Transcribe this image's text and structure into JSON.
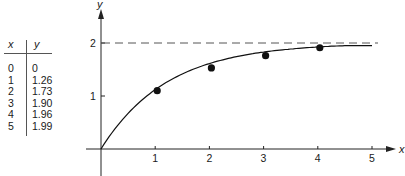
{
  "table": {
    "headers": [
      "x",
      "y"
    ],
    "rows": [
      {
        "x": "0",
        "y": "0"
      },
      {
        "x": "1",
        "y": "1.26"
      },
      {
        "x": "2",
        "y": "1.73"
      },
      {
        "x": "3",
        "y": "1.90"
      },
      {
        "x": "4",
        "y": "1.96"
      },
      {
        "x": "5",
        "y": "1.99"
      }
    ]
  },
  "chart_data": {
    "type": "line",
    "title": "",
    "xlabel": "x",
    "ylabel": "y",
    "x_ticks": [
      "1",
      "2",
      "3",
      "4",
      "5"
    ],
    "y_ticks": [
      "1",
      "2"
    ],
    "xlim": [
      0,
      5
    ],
    "ylim": [
      0,
      2
    ],
    "asymptote": {
      "y": 2,
      "style": "dashed"
    },
    "series": [
      {
        "name": "curve",
        "style": "line",
        "x": [
          0,
          1,
          2,
          3,
          4,
          5
        ],
        "y": [
          0,
          1.26,
          1.73,
          1.9,
          1.96,
          1.99
        ]
      },
      {
        "name": "points",
        "style": "markers",
        "x": [
          1,
          2,
          3,
          4
        ],
        "y": [
          1.1,
          1.53,
          1.76,
          1.91
        ]
      }
    ],
    "grid": false,
    "legend": null
  }
}
